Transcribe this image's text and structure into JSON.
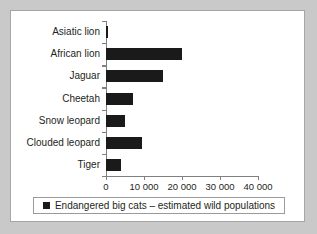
{
  "chart_data": {
    "type": "bar",
    "orientation": "horizontal",
    "title": "",
    "xlabel": "",
    "ylabel": "",
    "xlim": [
      0,
      40000
    ],
    "grid": false,
    "legend_position": "bottom",
    "categories": [
      "Asiatic lion",
      "African lion",
      "Jaguar",
      "Cheetah",
      "Snow leopard",
      "Clouded leopard",
      "Tiger"
    ],
    "values": [
      500,
      20000,
      15000,
      7000,
      5000,
      9500,
      4000
    ],
    "xticks": [
      0,
      10000,
      20000,
      30000,
      40000
    ],
    "xtick_labels": [
      "0",
      "10 000",
      "20 000",
      "30 000",
      "40 000"
    ],
    "series": [
      {
        "name": "Endangered big cats – estimated wild populations",
        "color": "#1a1a1a",
        "values": [
          500,
          20000,
          15000,
          7000,
          5000,
          9500,
          4000
        ]
      }
    ]
  },
  "legend": {
    "label": "Endangered big cats – estimated wild populations",
    "swatch_color": "#1a1a1a"
  },
  "colors": {
    "background": "#c9c9c9",
    "panel": "#ffffff",
    "bar": "#1a1a1a",
    "axis": "#808080",
    "text": "#231f20"
  }
}
